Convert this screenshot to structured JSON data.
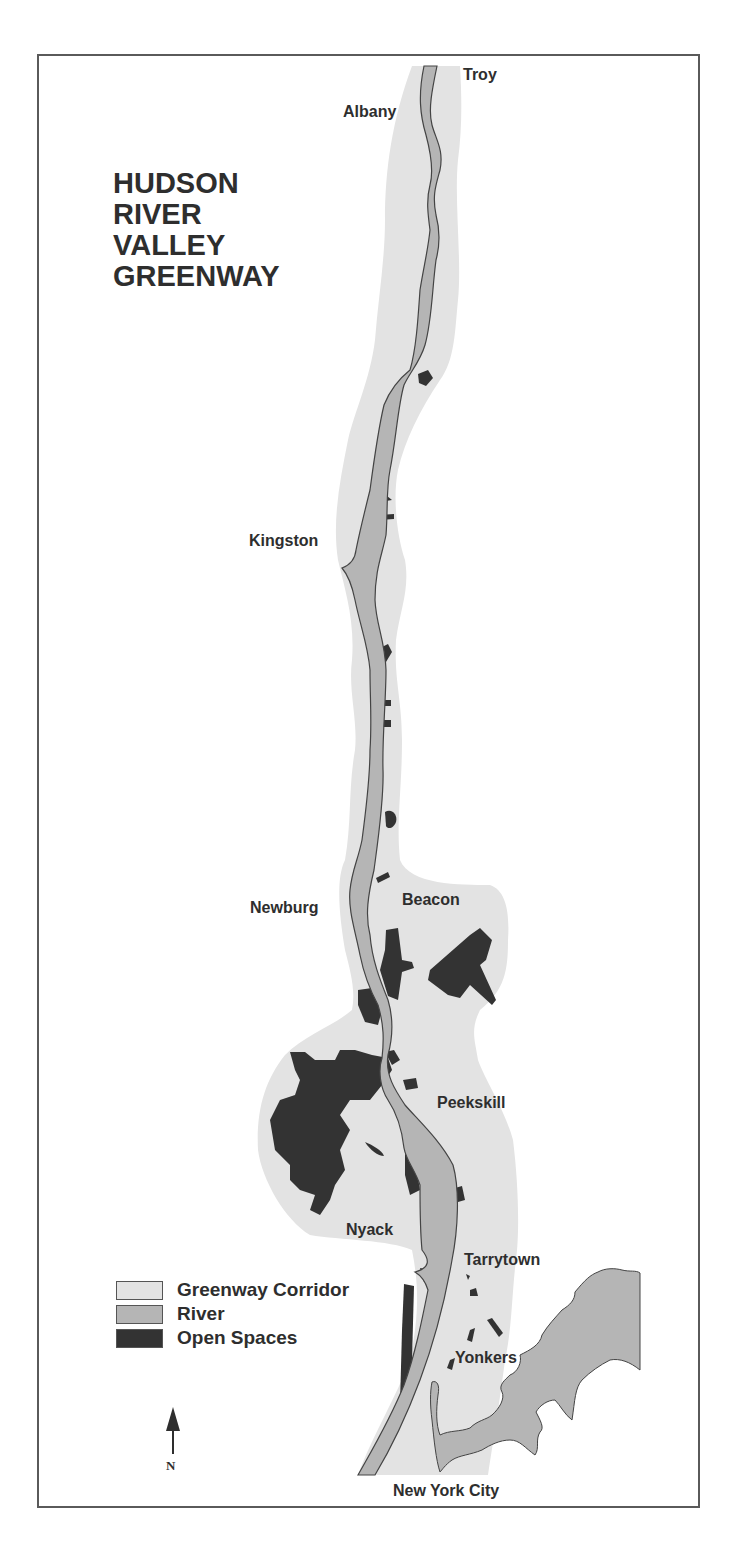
{
  "map": {
    "title_lines": [
      "HUDSON",
      "RIVER",
      "VALLEY",
      "GREENWAY"
    ],
    "colors": {
      "corridor": "#e3e3e3",
      "river": "#b5b5b5",
      "open_space": "#333333",
      "outline": "#444444",
      "frame": "#5a5a5a",
      "text": "#2e2e2e"
    },
    "places": [
      {
        "name": "Troy"
      },
      {
        "name": "Albany"
      },
      {
        "name": "Kingston"
      },
      {
        "name": "Newburg"
      },
      {
        "name": "Beacon"
      },
      {
        "name": "Peekskill"
      },
      {
        "name": "Nyack"
      },
      {
        "name": "Tarrytown"
      },
      {
        "name": "Yonkers"
      },
      {
        "name": "New York City"
      }
    ],
    "legend": [
      {
        "label": "Greenway Corridor",
        "color": "#e3e3e3"
      },
      {
        "label": "River",
        "color": "#b5b5b5"
      },
      {
        "label": "Open Spaces",
        "color": "#333333"
      }
    ],
    "north_arrow": {
      "label": "N"
    }
  }
}
